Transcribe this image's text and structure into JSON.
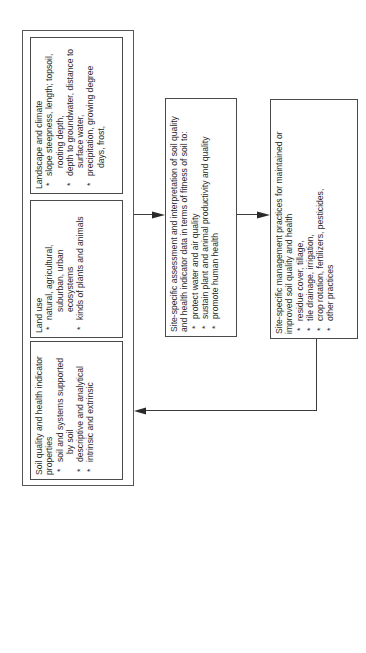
{
  "diagram": {
    "orientation": "rotated 90 degrees counter-clockwise",
    "outer_group": {
      "boxes": [
        {
          "title": "Landscape and climate",
          "items": [
            [
              "slope steepness, length; topsoil,",
              "rooting depth,"
            ],
            [
              "depth to groundwater, distance to",
              "surface water,"
            ],
            [
              "precipitation, growing degree",
              "days, frost,"
            ]
          ]
        },
        {
          "title": "Land use",
          "items": [
            [
              "natural, agricultural,",
              "suburban, urban",
              "ecosystems"
            ],
            [
              "kinds of plants and animals"
            ]
          ]
        },
        {
          "title": "Soil quality and health indicator",
          "title2": "properties",
          "items": [
            [
              "soil and systems supported",
              "by soil"
            ],
            [
              "descriptive and analytical"
            ],
            [
              "intrinsic and extrinsic"
            ]
          ]
        }
      ]
    },
    "assessment_box": {
      "title": "Site-specific assessment and interpretation of soil quality",
      "title2": "and health indicator data in terms of fitness of soil to:",
      "items": [
        "protect water and air quality",
        "sustain plant and animal productivity and quality",
        "promote human health"
      ]
    },
    "management_box": {
      "title": "Site-specific management practices for maintained or",
      "title2": "improved soil quality and health",
      "items": [
        "residue cover, tillage,",
        "tile drainage, irrigation,",
        "crop rotation, fertilizers, pesticides,",
        "other practices"
      ]
    },
    "connectors": [
      {
        "from": "outer_group",
        "to": "assessment_box",
        "type": "arrow"
      },
      {
        "from": "assessment_box",
        "to": "management_box",
        "type": "arrow"
      },
      {
        "from": "management_box",
        "to": "outer_group",
        "type": "feedback-arrow"
      }
    ]
  }
}
